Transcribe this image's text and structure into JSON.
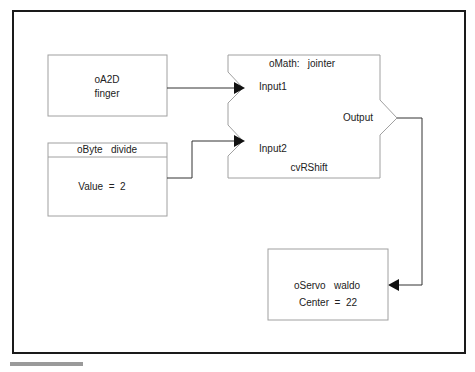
{
  "diagram": {
    "colors": {
      "frame": "#1a1a1a",
      "box": "#a0a0a0",
      "wire": "#333333",
      "text": "#222222"
    },
    "nodes": {
      "a2d": {
        "type": "oA2D",
        "name": "finger"
      },
      "byte": {
        "header": "oByte   divide",
        "value_label": "Value  =  2"
      },
      "math": {
        "title": "oMath:   jointer",
        "input1": "Input1",
        "input2": "Input2",
        "output": "Output",
        "function": "cvRShift"
      },
      "servo": {
        "title": "oServo   waldo",
        "value_label": "Center  =  22"
      }
    },
    "connections": [
      {
        "from": "oA2D finger",
        "to": "oMath jointer Input1"
      },
      {
        "from": "oByte divide",
        "to": "oMath jointer Input2"
      },
      {
        "from": "oMath jointer Output",
        "to": "oServo waldo"
      }
    ]
  }
}
